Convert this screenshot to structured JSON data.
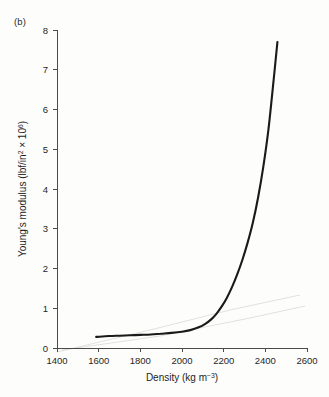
{
  "panel": {
    "label": "(b)"
  },
  "chart_data": {
    "type": "line",
    "title": "",
    "subtitle": "",
    "panel_label": "(b)",
    "xlabel_parts": {
      "base": "Density (kg m",
      "exponent": "−3",
      "close": ")"
    },
    "xlabel": "Density (kg m−3)",
    "ylabel_parts": {
      "base": "Young's modulus (lbf/in",
      "sup1": "2",
      "mid": " × 10",
      "sup2": "6",
      "close": ")"
    },
    "ylabel": "Young's modulus (lbf/in2 × 106)",
    "xlim": [
      1400,
      2600
    ],
    "ylim": [
      0,
      8
    ],
    "xticks": [
      1400,
      1600,
      1800,
      2000,
      2200,
      2400,
      2600
    ],
    "xticklabels": [
      "1400",
      "1600",
      "1800",
      "2000",
      "2200",
      "2400",
      "2600"
    ],
    "yticks": [
      0,
      1,
      2,
      3,
      4,
      5,
      6,
      7,
      8
    ],
    "yticklabels": [
      "0",
      "1",
      "2",
      "3",
      "4",
      "5",
      "6",
      "7",
      "8"
    ],
    "grid": false,
    "legend": null,
    "series": [
      {
        "name": "Young's modulus vs density",
        "color": "#1a1a1a",
        "x": [
          1588,
          1650,
          1700,
          1750,
          1800,
          1850,
          1900,
          1950,
          2000,
          2040,
          2080,
          2110,
          2140,
          2165,
          2190,
          2215,
          2240,
          2265,
          2290,
          2315,
          2340,
          2365,
          2390,
          2415,
          2440,
          2458
        ],
        "y": [
          0.28,
          0.3,
          0.31,
          0.32,
          0.33,
          0.34,
          0.36,
          0.38,
          0.41,
          0.45,
          0.52,
          0.6,
          0.72,
          0.86,
          1.04,
          1.26,
          1.53,
          1.85,
          2.22,
          2.65,
          3.15,
          3.78,
          4.55,
          5.5,
          6.75,
          7.7
        ]
      }
    ],
    "annotations": [
      {
        "name": "scan-bleed-through",
        "description": "faint grey line from reverse page",
        "visible": true
      }
    ]
  },
  "colors": {
    "background": "#fdfdfc",
    "axis": "#4a4a4a",
    "curve": "#1a1a1a",
    "text": "#1d1d1d",
    "bleed": "#dcdcdc"
  }
}
